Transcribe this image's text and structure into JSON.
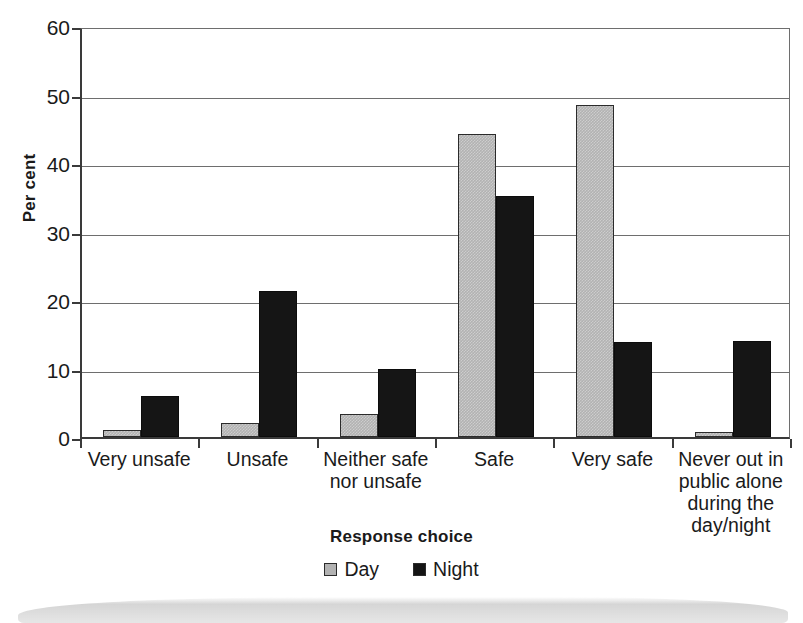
{
  "chart_data": {
    "type": "bar",
    "title": "",
    "xlabel": "Response choice",
    "ylabel": "Per cent",
    "ylim": [
      0,
      60
    ],
    "yticks": [
      0,
      10,
      20,
      30,
      40,
      50,
      60
    ],
    "grid": true,
    "legend_position": "bottom",
    "categories": [
      "Very unsafe",
      "Unsafe",
      "Neither safe nor unsafe",
      "Safe",
      "Very safe",
      "Never out in public alone during the day/night"
    ],
    "category_lines": [
      [
        "Very unsafe"
      ],
      [
        "Unsafe"
      ],
      [
        "Neither safe",
        "nor unsafe"
      ],
      [
        "Safe"
      ],
      [
        "Very safe"
      ],
      [
        "Never out in",
        "public alone",
        "during the",
        "day/night"
      ]
    ],
    "series": [
      {
        "name": "Day",
        "color": "#b2b2b2",
        "values": [
          1.0,
          2.1,
          3.3,
          44.3,
          48.4,
          0.7
        ]
      },
      {
        "name": "Night",
        "color": "#151515",
        "values": [
          6.0,
          21.3,
          9.9,
          35.2,
          13.9,
          14.0
        ]
      }
    ]
  },
  "legend": {
    "items": [
      {
        "label": "Day",
        "swatch": "day"
      },
      {
        "label": "Night",
        "swatch": "night"
      }
    ]
  }
}
